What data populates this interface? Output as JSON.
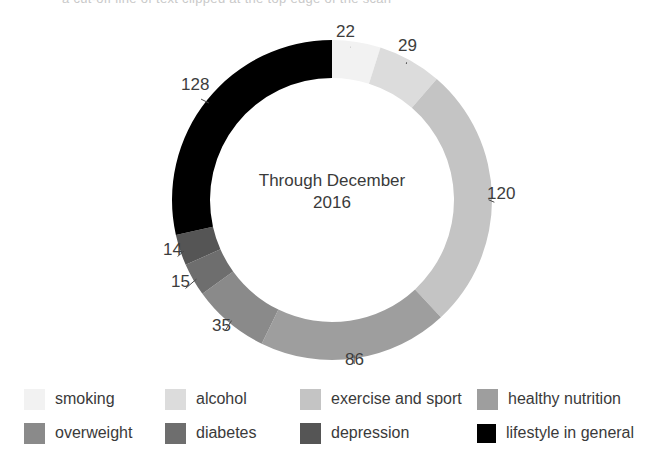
{
  "top_partial_text": "a cut-off line of text clipped at the top edge of the scan",
  "chart_data": {
    "type": "pie",
    "variant": "donut",
    "title": "",
    "center_label_line1": "Through December",
    "center_label_line2": "2016",
    "total": 449,
    "start_angle_deg": 0,
    "direction": "clockwise",
    "categories": [
      "smoking",
      "alcohol",
      "exercise and sport",
      "healthy nutrition",
      "overweight",
      "diabetes",
      "depression",
      "lifestyle in general"
    ],
    "values": [
      22,
      29,
      120,
      86,
      35,
      15,
      14,
      128
    ],
    "colors": [
      "#f2f2f2",
      "#dcdcdc",
      "#c4c4c4",
      "#9e9e9e",
      "#8a8a8a",
      "#6e6e6e",
      "#555555",
      "#000000"
    ],
    "slice_labels": [
      "22",
      "29",
      "120",
      "86",
      "35",
      "15",
      "14",
      "128"
    ],
    "legend_position": "bottom",
    "grid": false
  },
  "labels": [
    {
      "text": "22",
      "left": 336,
      "top": 22
    },
    {
      "text": "29",
      "left": 398,
      "top": 36
    },
    {
      "text": "120",
      "left": 487,
      "top": 184
    },
    {
      "text": "86",
      "left": 345,
      "top": 350
    },
    {
      "text": "35",
      "left": 212,
      "top": 316
    },
    {
      "text": "15",
      "left": 171,
      "top": 272
    },
    {
      "text": "14",
      "left": 163,
      "top": 240
    },
    {
      "text": "128",
      "left": 181,
      "top": 75
    }
  ],
  "legend": {
    "rows": [
      [
        {
          "label": "smoking",
          "color": "#f2f2f2",
          "left": 24
        },
        {
          "label": "alcohol",
          "color": "#dcdcdc",
          "left": 165
        },
        {
          "label": "exercise and sport",
          "color": "#c4c4c4",
          "left": 300
        },
        {
          "label": "healthy nutrition",
          "color": "#9e9e9e",
          "left": 477
        }
      ],
      [
        {
          "label": "overweight",
          "color": "#8a8a8a",
          "left": 24
        },
        {
          "label": "diabetes",
          "color": "#6e6e6e",
          "left": 165
        },
        {
          "label": "depression",
          "color": "#555555",
          "left": 300
        },
        {
          "label": "lifestyle in general",
          "color": "#000000",
          "left": 477
        }
      ]
    ]
  }
}
